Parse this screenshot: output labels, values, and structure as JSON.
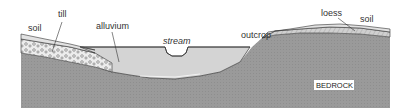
{
  "diagram": {
    "labels": {
      "soil_left": "soil",
      "till": "till",
      "alluvium": "alluvium",
      "stream": "stream",
      "outcrop": "outcrop",
      "loess": "loess",
      "soil_right": "soil",
      "bedrock": "BEDROCK"
    },
    "colors": {
      "bedrock": "#9a9a9a",
      "alluvium": "#d4d4d4",
      "till": "#ececec",
      "loess": "#cfcfcf",
      "soil": "#e2e2e2",
      "outline": "#333333",
      "background": "#ffffff"
    }
  }
}
